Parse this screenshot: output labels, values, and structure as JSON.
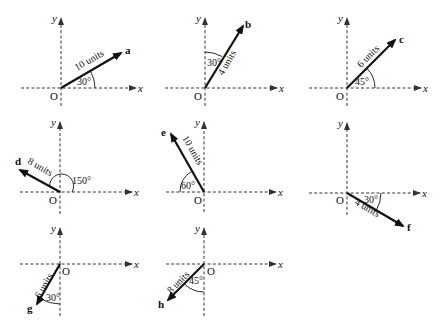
{
  "diagram": {
    "title": "",
    "axis_labels": {
      "x": "x",
      "y": "y",
      "origin": "O"
    },
    "panels": [
      {
        "id": "a",
        "vector_label": "a",
        "magnitude": 10,
        "magnitude_label": "10 units",
        "angle_label": "30°",
        "angle_ref": "from +x axis, counter-clockwise",
        "direction_deg": 30,
        "origin": [
          61,
          88
        ]
      },
      {
        "id": "b",
        "vector_label": "b",
        "magnitude": 4,
        "magnitude_label": "4 units",
        "angle_label": "30°",
        "angle_ref": "from +y axis, clockwise",
        "direction_deg": 60,
        "origin": [
          205,
          88
        ]
      },
      {
        "id": "c",
        "vector_label": "c",
        "magnitude": 6,
        "magnitude_label": "6 units",
        "angle_label": "45°",
        "angle_ref": "from +x axis, counter-clockwise",
        "direction_deg": 45,
        "origin": [
          347,
          88
        ]
      },
      {
        "id": "d",
        "vector_label": "d",
        "magnitude": 8,
        "magnitude_label": "8 units",
        "angle_label": "150°",
        "angle_ref": "from +x axis, counter-clockwise",
        "direction_deg": 150,
        "origin": [
          60,
          192
        ]
      },
      {
        "id": "e",
        "vector_label": "e",
        "magnitude": 10,
        "magnitude_label": "10 units",
        "angle_label": "60°",
        "angle_ref": "from -x axis, clockwise",
        "direction_deg": 120,
        "origin": [
          204,
          192
        ]
      },
      {
        "id": "f",
        "vector_label": "f",
        "magnitude": 4,
        "magnitude_label": "4 units",
        "angle_label": "30°",
        "angle_ref": "from +x axis, clockwise",
        "direction_deg": -30,
        "origin": [
          347,
          193
        ]
      },
      {
        "id": "g",
        "vector_label": "g",
        "magnitude": 6,
        "magnitude_label": "6 units",
        "angle_label": "30°",
        "angle_ref": "from -y axis, clockwise",
        "direction_deg": 240,
        "origin": [
          60,
          264
        ]
      },
      {
        "id": "h",
        "vector_label": "h",
        "magnitude": 8,
        "magnitude_label": "8 units",
        "angle_label": "45°",
        "angle_ref": "from -y axis, clockwise",
        "direction_deg": 225,
        "origin": [
          204,
          264
        ]
      }
    ]
  }
}
